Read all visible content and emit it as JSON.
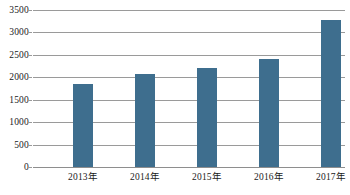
{
  "chart_data": {
    "type": "bar",
    "title": "",
    "xlabel": "",
    "ylabel": "",
    "categories": [
      "2013年",
      "2014年",
      "2015年",
      "2016年",
      "2017年"
    ],
    "values": [
      1850,
      2080,
      2200,
      2400,
      3270
    ],
    "series": [
      {
        "name": "",
        "values": [
          1850,
          2080,
          2200,
          2400,
          3270
        ]
      }
    ],
    "ylim": [
      0,
      3500
    ],
    "y_ticks": [
      0,
      500,
      1000,
      1500,
      2000,
      2500,
      3000,
      3500
    ],
    "y_tick_labels": [
      "0",
      "500",
      "1000",
      "1500",
      "2000",
      "2500",
      "3000",
      "3500"
    ],
    "grid": true,
    "legend": false,
    "legend_position": "none",
    "bar_color": "#3e6e8e",
    "gridline_color": "#9a9a9a",
    "background_color": "#ffffff",
    "annotations": []
  }
}
